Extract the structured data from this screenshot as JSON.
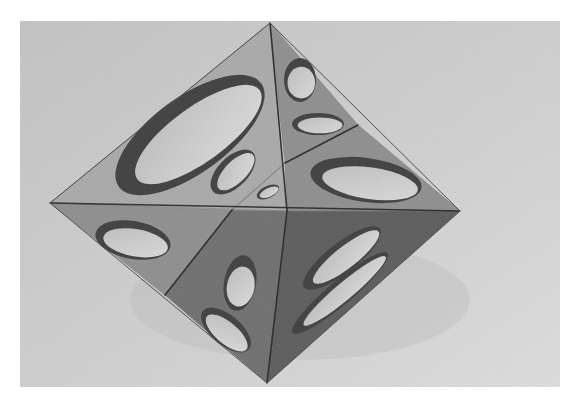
{
  "image": {
    "description": "Grayscale photograph of a cut-out octahedral sculpture with elliptical openings in each triangular face, resting on a light gray surface",
    "width": 582,
    "height": 405,
    "border_color": "#ffffff",
    "photo_rect": {
      "x": 20,
      "y": 21,
      "w": 540,
      "h": 366
    }
  },
  "colors": {
    "background_top": "#c4c4c4",
    "background_bottom": "#d8d8d8",
    "face_light": "#a9a9a9",
    "face_mid": "#8e8e8e",
    "face_dark": "#6f6f6f",
    "face_darker": "#5c5c5c",
    "hole_fill": "#d2d2d2",
    "hole_shadow": "#3f3f3f",
    "edge": "#222222"
  },
  "octahedron": {
    "vertices": {
      "top": [
        270,
        23
      ],
      "left": [
        50,
        203
      ],
      "right": [
        460,
        211
      ],
      "bottom": [
        267,
        383
      ],
      "center": [
        287,
        211
      ],
      "upper_right_edge_point": [
        358,
        125
      ],
      "lower_left_edge_point": [
        165,
        295
      ],
      "equator_left_split": [
        232,
        210
      ]
    },
    "faces": [
      {
        "name": "upper-left-face",
        "points": [
          [
            270,
            23
          ],
          [
            50,
            203
          ],
          [
            287,
            211
          ]
        ],
        "shade": "face_light"
      },
      {
        "name": "upper-right-top-face",
        "points": [
          [
            270,
            23
          ],
          [
            358,
            125
          ],
          [
            285,
            163
          ]
        ],
        "shade": "face_mid"
      },
      {
        "name": "upper-right-bottom-face",
        "points": [
          [
            285,
            163
          ],
          [
            358,
            125
          ],
          [
            460,
            211
          ],
          [
            287,
            211
          ]
        ],
        "shade": "face_mid"
      },
      {
        "name": "lower-left-outer-face",
        "points": [
          [
            50,
            203
          ],
          [
            232,
            210
          ],
          [
            165,
            295
          ]
        ],
        "shade": "face_mid"
      },
      {
        "name": "lower-left-inner-face",
        "points": [
          [
            232,
            210
          ],
          [
            287,
            211
          ],
          [
            267,
            383
          ],
          [
            165,
            295
          ]
        ],
        "shade": "face_dark"
      },
      {
        "name": "lower-right-face",
        "points": [
          [
            287,
            211
          ],
          [
            460,
            211
          ],
          [
            267,
            383
          ]
        ],
        "shade": "face_darker"
      }
    ],
    "holes": [
      {
        "name": "upper-left-large-ellipse-hole",
        "cx": 190,
        "cy": 135,
        "rx": 88,
        "ry": 38,
        "rotate": -36
      },
      {
        "name": "upper-left-inner-hole",
        "cx": 233,
        "cy": 172,
        "rx": 28,
        "ry": 15,
        "rotate": -45
      },
      {
        "name": "center-small-oval-hole",
        "cx": 268,
        "cy": 192,
        "rx": 12,
        "ry": 6,
        "rotate": -25
      },
      {
        "name": "upper-right-teardrop-hole",
        "cx": 300,
        "cy": 80,
        "rx": 16,
        "ry": 22,
        "rotate": 0
      },
      {
        "name": "upper-right-semicircle-hole",
        "cx": 318,
        "cy": 124,
        "rx": 26,
        "ry": 11,
        "rotate": 0
      },
      {
        "name": "upper-right-bottom-ellipse-hole",
        "cx": 366,
        "cy": 180,
        "rx": 56,
        "ry": 22,
        "rotate": 8
      },
      {
        "name": "lower-left-outer-ellipse-hole",
        "cx": 133,
        "cy": 240,
        "rx": 38,
        "ry": 19,
        "rotate": 10
      },
      {
        "name": "lower-left-inner-upper-hole",
        "cx": 240,
        "cy": 283,
        "rx": 16,
        "ry": 28,
        "rotate": 10
      },
      {
        "name": "lower-left-inner-lower-hole",
        "cx": 226,
        "cy": 330,
        "rx": 30,
        "ry": 15,
        "rotate": 40
      },
      {
        "name": "lower-right-upper-ellipse-hole",
        "cx": 342,
        "cy": 258,
        "rx": 48,
        "ry": 15,
        "rotate": -38
      },
      {
        "name": "lower-right-lower-ellipse-hole",
        "cx": 340,
        "cy": 293,
        "rx": 62,
        "ry": 12,
        "rotate": -40
      }
    ],
    "edges": [
      {
        "name": "equator-edge",
        "from": [
          50,
          203
        ],
        "to": [
          460,
          211
        ]
      },
      {
        "name": "vertical-upper-edge",
        "from": [
          270,
          23
        ],
        "to": [
          287,
          211
        ]
      },
      {
        "name": "vertical-lower-edge",
        "from": [
          287,
          211
        ],
        "to": [
          267,
          383
        ]
      },
      {
        "name": "upper-right-diagonal-edge",
        "from": [
          285,
          163
        ],
        "to": [
          358,
          125
        ]
      },
      {
        "name": "lower-left-diagonal-edge",
        "from": [
          232,
          210
        ],
        "to": [
          165,
          295
        ]
      },
      {
        "name": "upper-left-faint-edge",
        "from": [
          232,
          210
        ],
        "to": [
          285,
          163
        ]
      }
    ]
  }
}
